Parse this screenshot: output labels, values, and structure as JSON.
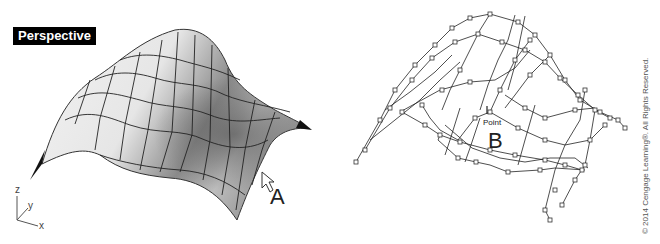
{
  "left_viewport": {
    "label": "Perspective",
    "view_type": "shaded-surface",
    "callout": "A",
    "axes": {
      "z": "z",
      "y": "y",
      "x": "x"
    }
  },
  "right_viewport": {
    "view_type": "control-point-wireframe",
    "callout": "B",
    "point_label": "Point"
  },
  "copyright": "© 2014 Cengage Learning®. All Rights Reserved."
}
